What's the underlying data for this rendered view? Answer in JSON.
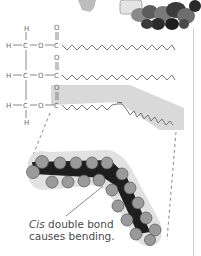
{
  "figure": {
    "type": "unsaturated fat molecule diagram",
    "structure": {
      "glycerol_atoms": [
        "H",
        "C",
        "O",
        "C",
        "O"
      ],
      "rows": [
        {
          "label": "H-C-O-C",
          "chain": "saturated"
        },
        {
          "label": "H-C-O-C",
          "chain": "saturated"
        },
        {
          "label": "H-C-O-C",
          "chain": "unsaturated (cis double bond)"
        }
      ],
      "top_H": "H",
      "bottom_H": "H",
      "carbonyl_O": "O"
    },
    "caption": {
      "italic": "Cis",
      "line1_rest": " double bond",
      "line2": "causes bending."
    },
    "colors": {
      "line": "#6a6a6a",
      "shade": "#d9d9d9",
      "atom_fill": "#9a9a9a",
      "bond_dark": "#1e1e1e",
      "rule": "#cfcfcf"
    }
  }
}
